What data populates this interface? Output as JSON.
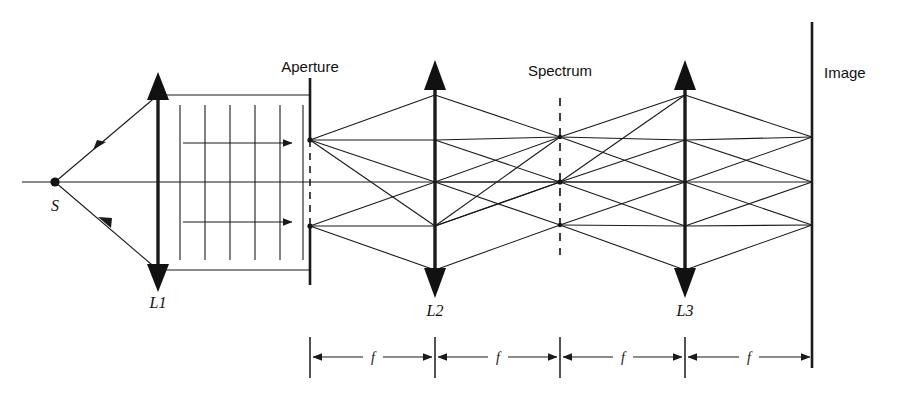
{
  "figure": {
    "background_color": "#ffffff",
    "line_color": "#1a1a1a",
    "width": 899,
    "height": 408
  },
  "labels": {
    "source": "S",
    "lens1": "L1",
    "lens2": "L2",
    "lens3": "L3",
    "aperture": "Aperture",
    "spectrum": "Spectrum",
    "image": "Image",
    "focal_1": "f",
    "focal_2": "f",
    "focal_3": "f",
    "focal_4": "f"
  },
  "geometry": {
    "axis_y": 182,
    "source_x": 55,
    "lens1_x": 158,
    "aperture_x": 310,
    "lens2_x": 435,
    "spectrum_x": 560,
    "lens3_x": 685,
    "image_x": 812,
    "beam_top_y": 95,
    "beam_bottom_y": 270,
    "aperture_point_top_y": 140,
    "aperture_point_bottom_y": 226,
    "dimension_line_y": 357
  },
  "elements": {
    "wavefront_count": 6,
    "propagation_arrow_count": 2,
    "lens_count": 3,
    "focal_segment_count": 4
  }
}
